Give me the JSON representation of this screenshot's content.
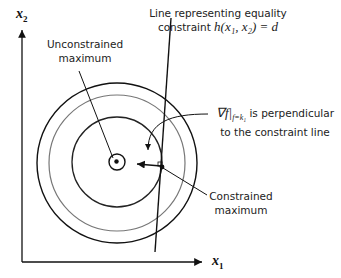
{
  "axes": {
    "x_label": "x",
    "x_sub": "1",
    "y_label": "x",
    "y_sub": "2"
  },
  "labels": {
    "unconstrained_line1": "Unconstrained",
    "unconstrained_line2": "maximum",
    "constraint_line1": "Line representing equality",
    "constraint_line2_prefix": "constraint ",
    "constraint_math": "h(x₁, x₂) = d",
    "gradient_math": "∇f|",
    "gradient_sub": "f=k₁",
    "gradient_line1_suffix": " is perpendicular",
    "gradient_line2": "to the constraint line",
    "constrained_line1": "Constrained",
    "constrained_line2": "maximum"
  },
  "colors": {
    "stroke": "#111111",
    "gray_contour": "#777777"
  }
}
